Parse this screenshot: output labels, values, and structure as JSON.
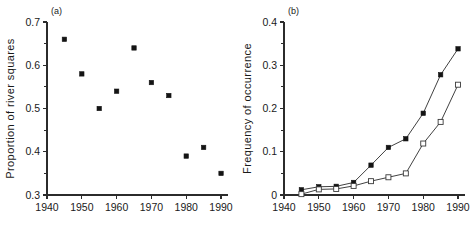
{
  "figure": {
    "width": 475,
    "height": 230,
    "background": "#ffffff",
    "ink_color": "#1a1a1a"
  },
  "chart_data": [
    {
      "type": "scatter",
      "panel_label": "(a)",
      "title": "",
      "xlabel": "",
      "ylabel": "Proportion of river squares",
      "x": [
        1945,
        1950,
        1955,
        1960,
        1965,
        1970,
        1975,
        1980,
        1985,
        1990
      ],
      "values": [
        0.66,
        0.58,
        0.5,
        0.54,
        0.64,
        0.56,
        0.53,
        0.39,
        0.41,
        0.35
      ],
      "series": [
        {
          "name": "Proportion of river squares",
          "marker": "filled-square",
          "line": false,
          "values": [
            0.66,
            0.58,
            0.5,
            0.54,
            0.64,
            0.56,
            0.53,
            0.39,
            0.41,
            0.35
          ]
        }
      ],
      "xlim": [
        1940,
        1992
      ],
      "ylim": [
        0.3,
        0.7
      ],
      "xticks": [
        1940,
        1950,
        1960,
        1970,
        1980,
        1990
      ],
      "xticklabels": [
        "1940",
        "1950",
        "1960",
        "1970",
        "1980",
        "1990"
      ],
      "yticks": [
        0.3,
        0.4,
        0.5,
        0.6,
        0.7
      ],
      "yticklabels": [
        "0.3",
        "0.4",
        "0.5",
        "0.6",
        "0.7"
      ],
      "yminorticks": [
        0.35,
        0.45,
        0.55,
        0.65
      ],
      "grid": false,
      "legend": "none"
    },
    {
      "type": "line",
      "panel_label": "(b)",
      "title": "",
      "xlabel": "",
      "ylabel": "Frequency of occurrence",
      "x": [
        1945,
        1950,
        1955,
        1960,
        1965,
        1970,
        1975,
        1980,
        1985,
        1990
      ],
      "series": [
        {
          "name": "filled-square series",
          "marker": "filled-square",
          "line": true,
          "values": [
            0.012,
            0.019,
            0.02,
            0.029,
            0.069,
            0.11,
            0.13,
            0.189,
            0.278,
            0.338
          ]
        },
        {
          "name": "open-square series",
          "marker": "open-square",
          "line": true,
          "values": [
            0.002,
            0.013,
            0.014,
            0.021,
            0.032,
            0.041,
            0.05,
            0.119,
            0.169,
            0.255
          ]
        }
      ],
      "xlim": [
        1940,
        1992
      ],
      "ylim": [
        0.0,
        0.4
      ],
      "xticks": [
        1940,
        1950,
        1960,
        1970,
        1980,
        1990
      ],
      "xticklabels": [
        "1940",
        "1950",
        "1960",
        "1970",
        "1980",
        "1990"
      ],
      "yticks": [
        0.0,
        0.1,
        0.2,
        0.3,
        0.4
      ],
      "yticklabels": [
        "0",
        "0.1",
        "0.2",
        "0.3",
        "0.4"
      ],
      "yminorticks": [
        0.05,
        0.15,
        0.25,
        0.35
      ],
      "grid": false,
      "legend": "none"
    }
  ]
}
